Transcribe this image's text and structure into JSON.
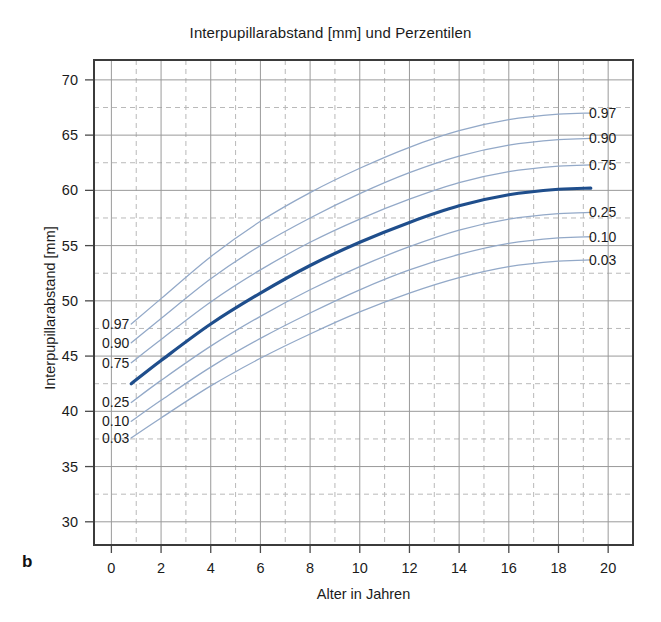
{
  "figure": {
    "panel_letter": "b",
    "title": "Interpupillarabstand [mm] und Perzentilen",
    "xlabel": "Alter in Jahren",
    "ylabel": "Interpupillarabstand [mm]"
  },
  "colors": {
    "median_curve": "#1f4e8c",
    "percentile_curve": "#93a9c8",
    "grid_solid": "#9a9a9a",
    "grid_dashed": "#b9b9b9",
    "axis_frame": "#3b3b3b",
    "text": "#1b1b1b"
  },
  "axis": {
    "y_ticks": [
      "70",
      "65",
      "60",
      "55",
      "50",
      "45",
      "40",
      "35",
      "30"
    ],
    "x_ticks": [
      "0",
      "2",
      "4",
      "6",
      "8",
      "10",
      "12",
      "14",
      "16",
      "18",
      "20"
    ]
  },
  "percentile_labels_left": [
    "0.97",
    "0.90",
    "0.75",
    "0.25",
    "0.10",
    "0.03"
  ],
  "percentile_labels_right": [
    "0.97",
    "0.90",
    "0.75",
    "0.25",
    "0.10",
    "0.03"
  ],
  "chart_data": {
    "type": "line",
    "title": "Interpupillarabstand [mm] und Perzentilen",
    "xlabel": "Alter in Jahren",
    "ylabel": "Interpupillarabstand [mm]",
    "xlim": [
      -0.7,
      21.0
    ],
    "ylim": [
      27.9,
      71.8
    ],
    "x_ticks": [
      0,
      2,
      4,
      6,
      8,
      10,
      12,
      14,
      16,
      18,
      20
    ],
    "y_ticks": [
      30,
      35,
      40,
      45,
      50,
      55,
      60,
      65,
      70
    ],
    "grid": true,
    "grid_minor": true,
    "legend": "inline end-labels on both sides of the plot",
    "x": [
      0.8,
      2,
      4,
      6,
      8,
      10,
      12,
      14,
      16,
      18,
      19.3
    ],
    "series": [
      {
        "name": "0.97",
        "label": "0.97",
        "color": "#93a9c8",
        "width": 1.3,
        "values": [
          47.9,
          50.2,
          54.0,
          57.2,
          59.8,
          62.0,
          63.9,
          65.4,
          66.4,
          66.9,
          67.0
        ]
      },
      {
        "name": "0.90",
        "label": "0.90",
        "color": "#93a9c8",
        "width": 1.3,
        "values": [
          46.2,
          48.4,
          52.0,
          55.0,
          57.5,
          59.7,
          61.6,
          63.1,
          64.1,
          64.6,
          64.7
        ]
      },
      {
        "name": "0.75",
        "label": "0.75",
        "color": "#93a9c8",
        "width": 1.3,
        "values": [
          44.4,
          46.5,
          49.9,
          52.8,
          55.3,
          57.4,
          59.2,
          60.7,
          61.7,
          62.2,
          62.3
        ]
      },
      {
        "name": "0.50",
        "label": "",
        "color": "#1f4e8c",
        "width": 3.2,
        "values": [
          42.5,
          44.6,
          47.9,
          50.7,
          53.2,
          55.3,
          57.1,
          58.6,
          59.6,
          60.1,
          60.2
        ]
      },
      {
        "name": "0.25",
        "label": "0.25",
        "color": "#93a9c8",
        "width": 1.3,
        "values": [
          40.8,
          42.8,
          45.9,
          48.6,
          51.0,
          53.1,
          54.9,
          56.4,
          57.4,
          57.9,
          58.0
        ]
      },
      {
        "name": "0.10",
        "label": "0.10",
        "color": "#93a9c8",
        "width": 1.3,
        "values": [
          39.1,
          41.0,
          44.0,
          46.6,
          48.9,
          51.0,
          52.8,
          54.2,
          55.2,
          55.7,
          55.8
        ]
      },
      {
        "name": "0.03",
        "label": "0.03",
        "color": "#93a9c8",
        "width": 1.3,
        "values": [
          37.6,
          39.4,
          42.3,
          44.8,
          47.0,
          49.0,
          50.7,
          52.1,
          53.1,
          53.6,
          53.7
        ]
      }
    ]
  }
}
